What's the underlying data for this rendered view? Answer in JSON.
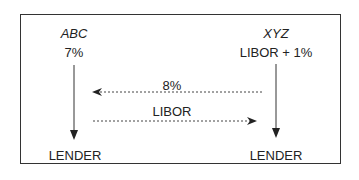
{
  "parties": {
    "left": {
      "name": "ABC",
      "rate": "7%",
      "lender": "LENDER"
    },
    "right": {
      "name": "XYZ",
      "rate": "LIBOR + 1%",
      "lender": "LENDER"
    }
  },
  "flows": {
    "right_to_left": {
      "label": "8%"
    },
    "left_to_right": {
      "label": "LIBOR"
    }
  },
  "colors": {
    "line": "#333333",
    "text": "#222222",
    "background": "#ffffff"
  }
}
